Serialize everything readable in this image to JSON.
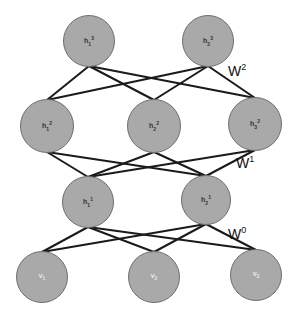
{
  "diagram": {
    "type": "layered-neural-network",
    "colors": {
      "node_fill": "#a9a9a9",
      "node_border": "#6f6f6f",
      "edge": "#1a1a1a",
      "background": "#ffffff"
    },
    "layers": [
      {
        "name": "hidden-3",
        "nodes": [
          {
            "id": "h1_3",
            "base": "h",
            "sub": "1",
            "sup": "3",
            "x": 89,
            "y": 41,
            "r": 26
          },
          {
            "id": "h2_3",
            "base": "h",
            "sub": "2",
            "sup": "3",
            "x": 208,
            "y": 41,
            "r": 26
          }
        ]
      },
      {
        "name": "hidden-2",
        "nodes": [
          {
            "id": "h1_2",
            "base": "h",
            "sub": "1",
            "sup": "2",
            "x": 47,
            "y": 126,
            "r": 27
          },
          {
            "id": "h2_2",
            "base": "h",
            "sub": "2",
            "sup": "2",
            "x": 154,
            "y": 126,
            "r": 27
          },
          {
            "id": "h3_2",
            "base": "h",
            "sub": "3",
            "sup": "2",
            "x": 255,
            "y": 124,
            "r": 27
          }
        ]
      },
      {
        "name": "hidden-1",
        "nodes": [
          {
            "id": "h1_1",
            "base": "h",
            "sub": "1",
            "sup": "1",
            "x": 88,
            "y": 202,
            "r": 26
          },
          {
            "id": "h2_1",
            "base": "h",
            "sub": "2",
            "sup": "1",
            "x": 206,
            "y": 200,
            "r": 25
          }
        ]
      },
      {
        "name": "visible",
        "nodes": [
          {
            "id": "v1",
            "base": "v",
            "sub": "1",
            "sup": "",
            "x": 42,
            "y": 277,
            "r": 26
          },
          {
            "id": "v2",
            "base": "v",
            "sub": "2",
            "sup": "",
            "x": 154,
            "y": 277,
            "r": 26
          },
          {
            "id": "v3",
            "base": "v",
            "sub": "3",
            "sup": "",
            "x": 256,
            "y": 275,
            "r": 26
          }
        ]
      }
    ],
    "weights": [
      {
        "label": "W",
        "sup": "2",
        "x": 228,
        "y": 62
      },
      {
        "label": "W",
        "sup": "1",
        "x": 236,
        "y": 154
      },
      {
        "label": "W",
        "sup": "0",
        "x": 228,
        "y": 225
      }
    ]
  }
}
